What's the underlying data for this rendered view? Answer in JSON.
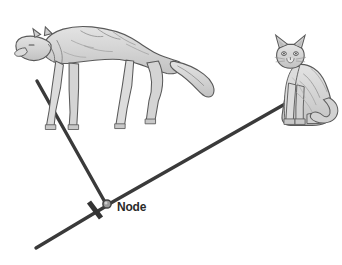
{
  "figure": {
    "title": "Node",
    "background_color": "#ffffff",
    "branch_color": "#3a3a3a",
    "label_color": "#2a2a2a",
    "node_marker_color": "#8c8c8c",
    "node_marker_outline": "#3a3a3a",
    "tick_color": "#333333",
    "artwork_ink": "#4a4a4a",
    "artwork_fill": "#d9d9d9"
  },
  "labels": {
    "node": "Node"
  },
  "taxa": [
    {
      "id": "wolf",
      "name": "wolf-illustration",
      "common_name": "Wolf",
      "position": "top-left",
      "facing": "left",
      "pose": "walking"
    },
    {
      "id": "cat",
      "name": "cat-illustration",
      "common_name": "Cat",
      "position": "top-right",
      "facing": "left",
      "pose": "sitting"
    }
  ],
  "branches": [
    {
      "id": "wolf-branch",
      "from": [
        37,
        81
      ],
      "to": [
        106,
        204
      ],
      "leads_to": "wolf"
    },
    {
      "id": "cat-branch",
      "from": [
        285,
        104
      ],
      "to": [
        109,
        204
      ],
      "leads_to": "cat"
    },
    {
      "id": "ancestral-branch",
      "from": [
        107,
        205
      ],
      "to": [
        36,
        248
      ],
      "leads_to": "root"
    }
  ],
  "node": {
    "id": "common-ancestor-node",
    "position": [
      107,
      204
    ],
    "radius": 4
  },
  "tick_mark": {
    "id": "character-change-tick",
    "position": [
      95,
      210
    ],
    "length": 18,
    "thickness": 5
  }
}
